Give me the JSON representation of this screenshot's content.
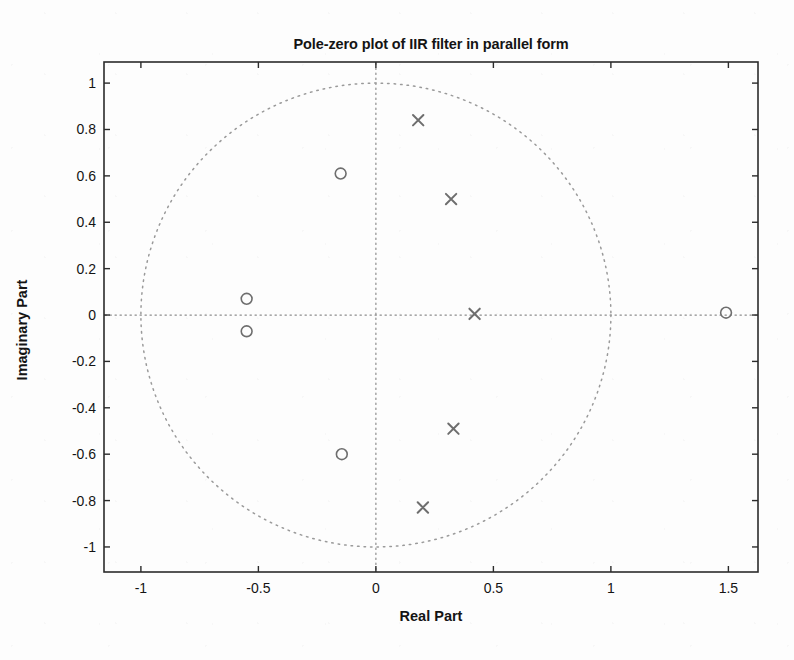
{
  "chart_data": {
    "type": "scatter",
    "title": "Pole-zero plot of IIR filter in parallel form",
    "xlabel": "Real Part",
    "ylabel": "Imaginary Part",
    "xlim": [
      -1.157,
      1.626
    ],
    "ylim": [
      -1.108,
      1.091
    ],
    "xticks": [
      -1,
      -0.5,
      0,
      0.5,
      1,
      1.5
    ],
    "xticklabels": [
      "-1",
      "-0.5",
      "0",
      "0.5",
      "1",
      "1.5"
    ],
    "yticks": [
      -1,
      -0.8,
      -0.6,
      -0.4,
      -0.2,
      0,
      0.2,
      0.4,
      0.6,
      0.8,
      1
    ],
    "yticklabels": [
      "-1",
      "-0.8",
      "-0.6",
      "-0.4",
      "-0.2",
      "0",
      "0.2",
      "0.4",
      "0.6",
      "0.8",
      "1"
    ],
    "grid": false,
    "legend": null,
    "marker_color": "#6e6e6e",
    "unit_circle": {
      "radius": 1,
      "center": [
        0,
        0
      ],
      "style": "dotted",
      "color": "#9a9a9a"
    },
    "axis_lines": {
      "style": "dotted",
      "color": "#8c8c8c",
      "x_zero": 0,
      "y_zero": 0
    },
    "series": [
      {
        "name": "poles",
        "marker": "x",
        "points": [
          {
            "real": 0.18,
            "imag": 0.84
          },
          {
            "real": 0.32,
            "imag": 0.5
          },
          {
            "real": 0.42,
            "imag": 0.005
          },
          {
            "real": 0.33,
            "imag": -0.49
          },
          {
            "real": 0.2,
            "imag": -0.83
          }
        ]
      },
      {
        "name": "zeros",
        "marker": "o",
        "points": [
          {
            "real": -0.15,
            "imag": 0.61
          },
          {
            "real": -0.55,
            "imag": 0.07
          },
          {
            "real": -0.55,
            "imag": -0.07
          },
          {
            "real": -0.145,
            "imag": -0.6
          },
          {
            "real": 1.49,
            "imag": 0.01
          }
        ]
      }
    ]
  },
  "figure": {
    "background": "#fdfdfd",
    "axes_color": "#2b2b2b"
  }
}
